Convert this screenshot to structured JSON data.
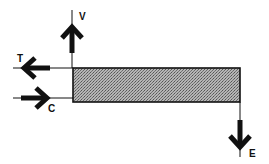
{
  "diagram": {
    "type": "force-diagram",
    "colors": {
      "line": "#111111",
      "block_fill": "#9a9a9a",
      "block_stroke": "#111111",
      "background": "#ffffff"
    },
    "block": {
      "x": 73,
      "y": 68,
      "width": 167,
      "height": 34,
      "pattern": "stipple"
    },
    "arrows": [
      {
        "id": "V",
        "label": "V",
        "direction": "up"
      },
      {
        "id": "T",
        "label": "T",
        "direction": "left"
      },
      {
        "id": "C",
        "label": "C",
        "direction": "right"
      },
      {
        "id": "E",
        "label": "E",
        "direction": "down"
      }
    ]
  }
}
